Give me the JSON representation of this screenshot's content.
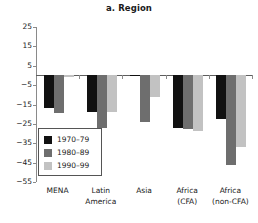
{
  "chart_data": {
    "type": "bar",
    "title": "a. Region",
    "xlabel": "",
    "ylabel": "",
    "ylim": [
      -55,
      25
    ],
    "yticks": [
      25,
      15,
      5,
      -5,
      -15,
      -25,
      -35,
      -45,
      -55
    ],
    "ytick_labels": [
      "25",
      "15",
      "5",
      "−5",
      "−15",
      "−25",
      "−35",
      "−45",
      "−55"
    ],
    "grid": false,
    "legend_position": "lower-left-inside",
    "categories": [
      "MENA",
      "Latin America",
      "Asia",
      "Africa (CFA)",
      "Africa (non-CFA)"
    ],
    "category_lines": [
      [
        "MENA"
      ],
      [
        "Latin",
        "America"
      ],
      [
        "Asia"
      ],
      [
        "Africa",
        "(CFA)"
      ],
      [
        "Africa",
        "(non-CFA)"
      ]
    ],
    "series": [
      {
        "name": "1970–79",
        "color": "#111111",
        "values": [
          -17,
          -19,
          -0.5,
          -27,
          -22.5
        ]
      },
      {
        "name": "1980–89",
        "color": "#6e6e6e",
        "values": [
          -19.5,
          -27,
          -24,
          -27.5,
          -46
        ]
      },
      {
        "name": "1990–99",
        "color": "#c2c2c2",
        "values": [
          -0.8,
          -19,
          -11,
          -28.5,
          -37
        ]
      }
    ]
  },
  "legend": {
    "items": [
      {
        "label": "1970–79",
        "color": "#111111"
      },
      {
        "label": "1980–89",
        "color": "#6e6e6e"
      },
      {
        "label": "1990–99",
        "color": "#c2c2c2"
      }
    ]
  }
}
